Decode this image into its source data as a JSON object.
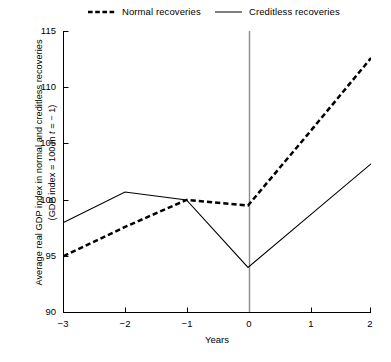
{
  "legend": {
    "entries": [
      {
        "label": "Normal recoveries",
        "style": "dashed",
        "swatch_icon": "dashed-line-icon"
      },
      {
        "label": "Creditless recoveries",
        "style": "solid",
        "swatch_icon": "solid-line-icon"
      }
    ]
  },
  "axes": {
    "y_title_line1": "Average real GDP index in normal and creditless recoveries",
    "y_title_line2_a": "(GDP index = 100 in ",
    "y_title_line2_italic": "t",
    "y_title_line2_b": " = − 1)",
    "x_title": "Years",
    "y_ticks": [
      "90",
      "95",
      "100",
      "105",
      "110",
      "115"
    ],
    "x_ticks": [
      "−3",
      "−2",
      "−1",
      "0",
      "1",
      "2"
    ]
  },
  "chart_data": {
    "type": "line",
    "title": "",
    "xlabel": "Years",
    "ylabel": "Average real GDP index in normal and creditless recoveries (GDP index = 100 in t = −1)",
    "x": [
      -3,
      -2,
      -1,
      0,
      1,
      2
    ],
    "xlim": [
      -3,
      2
    ],
    "ylim": [
      90,
      115
    ],
    "yticks": [
      90,
      95,
      100,
      105,
      110,
      115
    ],
    "xticks": [
      -3,
      -2,
      -1,
      0,
      1,
      2
    ],
    "grid": false,
    "legend_position": "top",
    "series": [
      {
        "name": "Normal recoveries",
        "style": "dashed",
        "color": "#000000",
        "values": [
          95.0,
          97.6,
          100.0,
          99.5,
          106.0,
          112.6
        ]
      },
      {
        "name": "Creditless recoveries",
        "style": "solid",
        "color": "#000000",
        "values": [
          98.0,
          100.7,
          100.0,
          94.0,
          98.6,
          103.2
        ]
      }
    ],
    "annotations": [
      {
        "type": "vline",
        "x": 0,
        "color": "#808080",
        "name": "trough-reference-line"
      }
    ]
  }
}
